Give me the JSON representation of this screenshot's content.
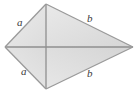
{
  "figure": {
    "name": "kite-quadrilateral-with-diagonals",
    "canvas": {
      "width": 138,
      "height": 92
    },
    "colors": {
      "background": "#ffffff",
      "fill_top": "#e6e6e6",
      "fill_bottom": "#dedede",
      "fill_left": "#e2e2e2",
      "fill_right": "#d8d8d8",
      "edge": "#9a9a9a",
      "diagonal": "#8f8f8f",
      "label_text": "#3a3a3a"
    },
    "vertices": {
      "top": {
        "x": 46,
        "y": 4
      },
      "left": {
        "x": 5,
        "y": 47
      },
      "bottom": {
        "x": 46,
        "y": 89
      },
      "right": {
        "x": 133,
        "y": 47
      }
    },
    "diagonals": [
      {
        "name": "horizontal-diagonal",
        "from": "left",
        "to": "right"
      },
      {
        "name": "vertical-diagonal",
        "from": "top",
        "to": "bottom"
      }
    ],
    "sides": [
      {
        "name": "side-top-left",
        "label": "a",
        "from": "top",
        "to": "left"
      },
      {
        "name": "side-bottom-left",
        "label": "a",
        "from": "left",
        "to": "bottom"
      },
      {
        "name": "side-top-right",
        "label": "b",
        "from": "top",
        "to": "right"
      },
      {
        "name": "side-bottom-right",
        "label": "b",
        "from": "right",
        "to": "bottom"
      }
    ],
    "labels": {
      "a_top": "a",
      "a_bottom": "a",
      "b_top": "b",
      "b_bottom": "b"
    }
  }
}
